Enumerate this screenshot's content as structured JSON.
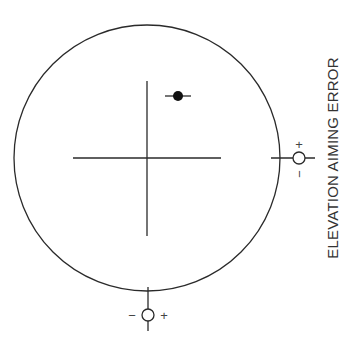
{
  "diagram": {
    "axis_label_vertical": "ELEVATION AIMING ERROR",
    "right_adjuster": {
      "plus_sign": "+",
      "minus_sign": "−"
    },
    "bottom_adjuster": {
      "plus_sign": "+",
      "minus_sign": "−"
    },
    "colors": {
      "line": "#2a2a2a",
      "text": "#333333",
      "background": "#ffffff"
    },
    "elements": {
      "outer_circle": {
        "cx": 147,
        "cy": 158,
        "r": 133
      },
      "crosshair": {
        "cx": 147,
        "cy": 158,
        "vertical_top": 81,
        "vertical_bottom": 236,
        "horizontal_left": 73,
        "horizontal_right": 221
      },
      "aim_point": {
        "cx": 178,
        "cy": 96,
        "r": 5,
        "line_left": 165,
        "line_right": 191
      },
      "right_adjuster_circle": {
        "cx": 299,
        "cy": 158,
        "r": 6
      },
      "bottom_adjuster_circle": {
        "cx": 148,
        "cy": 315,
        "r": 6
      }
    }
  }
}
